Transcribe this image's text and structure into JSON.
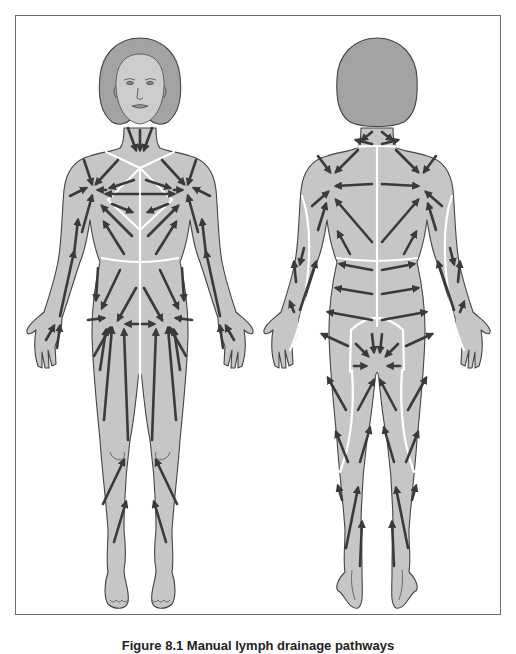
{
  "figure": {
    "caption": "Figure 8.1 Manual lymph drainage pathways",
    "caption_note": "caption partially cropped at bottom edge",
    "views": [
      {
        "id": "anterior",
        "label": "Front view",
        "description": "Female figure, anterior view, with arrows showing lymph drainage direction toward axillary and inguinal nodes; white watershed lines divide body territories"
      },
      {
        "id": "posterior",
        "label": "Back view",
        "description": "Female figure, posterior view, with arrows showing lymph drainage direction; white watershed lines on spine, waist, arms and legs"
      }
    ]
  },
  "colors": {
    "skin": "#c6c6c6",
    "hair": "#a3a3a3",
    "outline": "#444444",
    "arrow": "#3a3a3a",
    "watershed": "#ffffff",
    "frame": "#6e6e6e"
  }
}
